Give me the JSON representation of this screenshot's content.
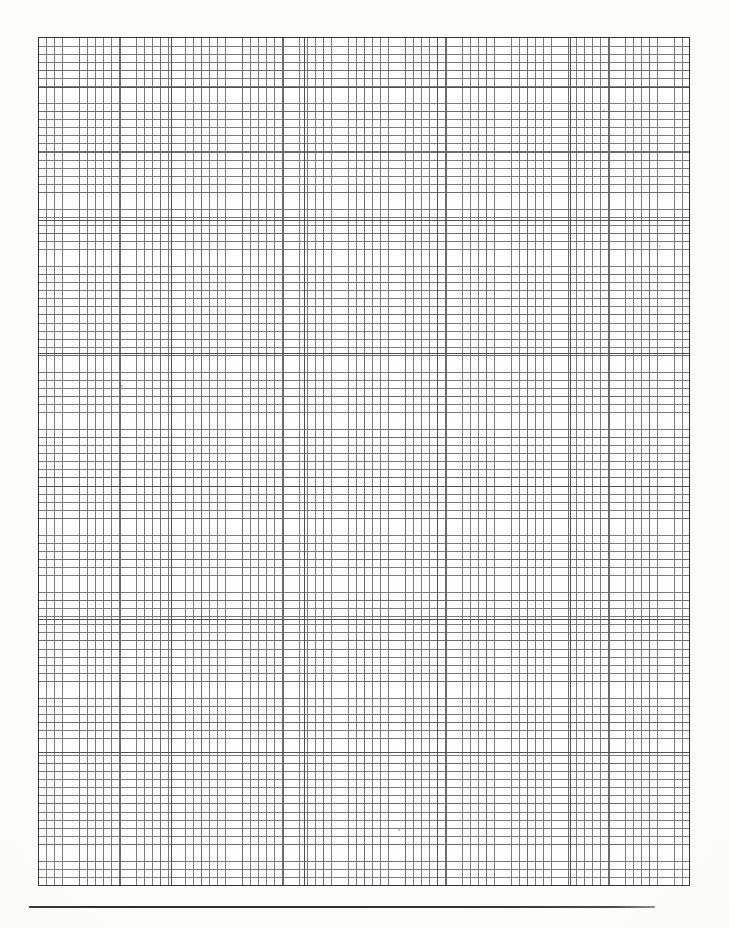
{
  "document": {
    "type": "graph-paper-scan",
    "title": "Blank graph paper sheet",
    "page_width_px": 729,
    "page_height_px": 928,
    "background_color": "#fdfdfb",
    "ink_color": "#3f3f3f",
    "has_text": false,
    "visible_text": ""
  },
  "grid": {
    "name": "graph-paper-grid",
    "left_px": 38,
    "top_px": 37,
    "width_px": 652,
    "height_px": 849,
    "minor_cell_px": 8.15,
    "minor_columns": 80,
    "minor_rows": 104,
    "major_every_n_cells": 5,
    "major_cell_px": 40.75,
    "block_every_n_major": 4,
    "block_cell_px": 133,
    "minor_line_color": "#6e6e6e",
    "major_line_color": "#5c5c5c",
    "block_line_color": "#3f3f3f",
    "border_color": "#333333",
    "border_width_px": 1.5,
    "cell_fill_color": "#ffffff"
  },
  "rule": {
    "name": "bottom-horizontal-rule",
    "left_px": 29,
    "top_px": 906,
    "width_px": 626,
    "height_px": 2,
    "color": "#2e2e2e"
  },
  "artifacts": {
    "vignette": "radial-edge-shading",
    "grain": "paper-speckle",
    "specks": [
      {
        "x": 121,
        "y": 385,
        "w": 2,
        "h": 2
      },
      {
        "x": 603,
        "y": 110,
        "w": 2,
        "h": 1
      },
      {
        "x": 398,
        "y": 829,
        "w": 2,
        "h": 2
      },
      {
        "x": 659,
        "y": 245,
        "w": 1,
        "h": 2
      },
      {
        "x": 250,
        "y": 562,
        "w": 1,
        "h": 1
      }
    ]
  },
  "chart_data": {
    "type": "table",
    "xlabel": "",
    "ylabel": "",
    "categories": [],
    "values": [],
    "grid": true,
    "legend": "none"
  }
}
